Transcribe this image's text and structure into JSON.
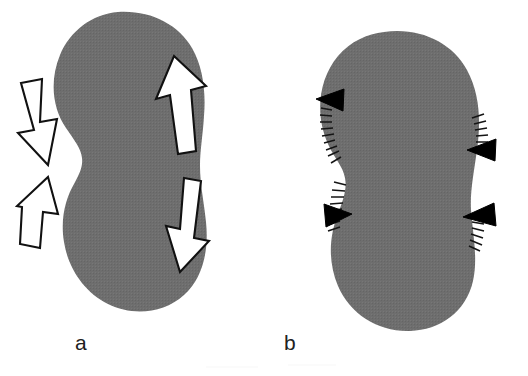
{
  "figure": {
    "background_color": "#ffffff",
    "shape_fill_color": "#6e6e6e",
    "outline_color": "#111111",
    "arrow_fill_color": "#ffffff",
    "arrowhead_color": "#000000",
    "label_color": "#212121",
    "panels": [
      {
        "id": "a",
        "label": "a",
        "shape_name": "bean-shape-outline",
        "description": "Gray bean shaped region with four hollow outlined arrows",
        "annotations": [
          {
            "name": "arrow-upper-left-inward",
            "style": "hollow-outlined-arrow",
            "direction": "down-right",
            "meaning": "inward force"
          },
          {
            "name": "arrow-lower-left-inward",
            "style": "hollow-outlined-arrow",
            "direction": "up-right",
            "meaning": "inward force"
          },
          {
            "name": "arrow-upper-right-outward",
            "style": "hollow-outlined-arrow",
            "direction": "up",
            "meaning": "outward growth"
          },
          {
            "name": "arrow-lower-right-outward",
            "style": "hollow-outlined-arrow",
            "direction": "down",
            "meaning": "outward growth"
          }
        ]
      },
      {
        "id": "b",
        "label": "b",
        "shape_name": "bean-shape-outline",
        "description": "Gray bean shaped region with four solid arrowheads and boundary hatch marks",
        "annotations": [
          {
            "name": "arrowhead-upper-left",
            "style": "solid-triangle-arrowhead",
            "direction": "left"
          },
          {
            "name": "arrowhead-lower-left",
            "style": "solid-triangle-arrowhead",
            "direction": "right"
          },
          {
            "name": "arrowhead-upper-right",
            "style": "solid-triangle-arrowhead",
            "direction": "left"
          },
          {
            "name": "arrowhead-lower-right",
            "style": "solid-triangle-arrowhead",
            "direction": "up-left"
          },
          {
            "name": "hatch-marks-upper-left",
            "style": "boundary-tick-marks"
          },
          {
            "name": "hatch-marks-lower-left",
            "style": "boundary-tick-marks"
          },
          {
            "name": "hatch-marks-upper-right",
            "style": "boundary-tick-marks"
          },
          {
            "name": "hatch-marks-lower-right",
            "style": "boundary-tick-marks"
          }
        ]
      }
    ]
  }
}
